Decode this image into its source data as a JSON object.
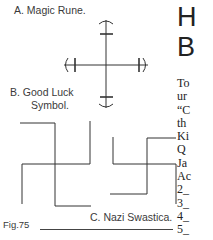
{
  "figure": {
    "captions": {
      "a": "A. Magic Rune.",
      "b_line1": "B. Good Luck",
      "b_line2": "Symbol.",
      "c": "C. Nazi Swastica."
    },
    "label": "Fig.75"
  },
  "heading": {
    "line1": "H",
    "line2": "B"
  },
  "body_lines": [
    "To",
    "ur",
    "“C",
    "th",
    "Ki",
    "Q",
    "Ja",
    "Ac",
    "2_",
    "3_",
    "4_",
    "5_"
  ]
}
